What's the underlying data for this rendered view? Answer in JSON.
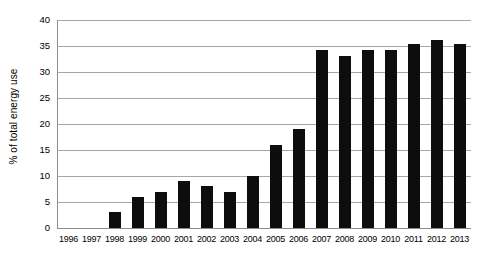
{
  "chart_data": {
    "type": "bar",
    "title": "",
    "xlabel": "",
    "ylabel": "% of total energy use",
    "categories": [
      "1996",
      "1997",
      "1998",
      "1999",
      "2000",
      "2001",
      "2002",
      "2003",
      "2004",
      "2005",
      "2006",
      "2007",
      "2008",
      "2009",
      "2010",
      "2011",
      "2012",
      "2013"
    ],
    "values": [
      0,
      0,
      3,
      6,
      7,
      9,
      8,
      7,
      10,
      16,
      19,
      34.3,
      33,
      34.2,
      34.3,
      35.3,
      36.2,
      35.3
    ],
    "ylim": [
      0,
      40
    ],
    "yticks": [
      0,
      5,
      10,
      15,
      20,
      25,
      30,
      35,
      40
    ],
    "ytick_labels": [
      "0",
      "5",
      "10",
      "15",
      "20",
      "25",
      "30",
      "35",
      "40"
    ],
    "grid": true,
    "legend": "none",
    "bar_color": "#0d0d0d",
    "gridline_color": "#a6a6a6",
    "background_color": "#ffffff"
  }
}
